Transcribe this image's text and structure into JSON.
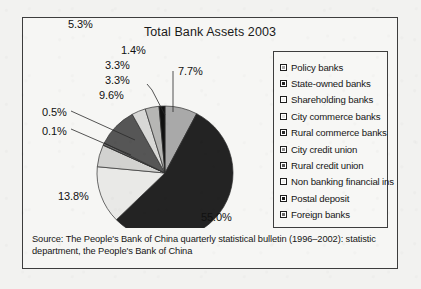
{
  "chart_data": {
    "type": "pie",
    "title": "Total Bank Assets 2003",
    "categories": [
      "Policy banks",
      "State-owned banks",
      "Shareholding banks",
      "City commerce banks",
      "Rural commerce banks",
      "City credit union",
      "Rural credit union",
      "Non banking financial ins",
      "Postal deposit",
      "Foreign banks"
    ],
    "values": [
      7.7,
      55.0,
      13.8,
      5.3,
      0.1,
      0.5,
      9.6,
      3.3,
      3.3,
      1.4
    ],
    "value_labels": [
      "7.7%",
      "55.0%",
      "13.8%",
      "5.3%",
      "0.1%",
      "0.5%",
      "9.6%",
      "3.3%",
      "3.3%",
      "1.4%"
    ],
    "unit": "%",
    "start_angle_deg": 0,
    "direction": "clockwise",
    "legend_position": "right",
    "grid": false,
    "slice_colors": [
      "#a9a9a9",
      "#232323",
      "#e9e9e7",
      "#d2d2d0",
      "#8f8f8f",
      "#6e6e6e",
      "#565656",
      "#d8d8d6",
      "#b6b6b4",
      "#111111"
    ]
  },
  "title": "Total Bank Assets 2003",
  "legend": {
    "items": [
      {
        "label": "Policy banks",
        "color": "#a9a9a9"
      },
      {
        "label": "State-owned banks",
        "color": "#232323"
      },
      {
        "label": "Shareholding banks",
        "color": "#f2f2f0"
      },
      {
        "label": "City commerce banks",
        "color": "#e4e4e2"
      },
      {
        "label": "Rural commerce banks",
        "color": "#2b2b2b"
      },
      {
        "label": "City credit union",
        "color": "#8f8f8f"
      },
      {
        "label": "Rural credit union",
        "color": "#555555"
      },
      {
        "label": "Non banking financial ins",
        "color": "#ededeb"
      },
      {
        "label": "Postal deposit",
        "color": "#1a1a1a"
      },
      {
        "label": "Foreign banks",
        "color": "#6b6b6b"
      }
    ]
  },
  "labels": {
    "p1_4": "1.4%",
    "p3_3a": "3.3%",
    "p3_3b": "3.3%",
    "p7_7": "7.7%",
    "p9_6": "9.6%",
    "p0_5": "0.5%",
    "p0_1": "0.1%",
    "p5_3": "5.3%",
    "p13_8": "13.8%",
    "p55_0": "55.0%"
  },
  "source": {
    "text": "Source: The People's Bank of China quarterly statistical bulletin (1996–2002): statistic department, the People's Bank of China"
  }
}
